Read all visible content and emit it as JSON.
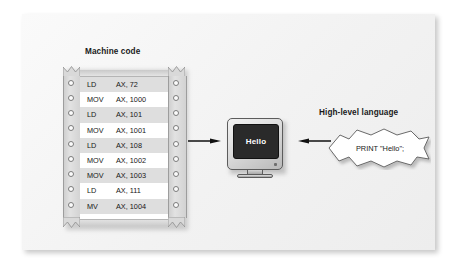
{
  "figure": {
    "machine_code_heading": "Machine code",
    "high_level_heading": "High-level language"
  },
  "machine_code": {
    "rows": [
      {
        "mnemonic": "LD",
        "operand": "AX, 72"
      },
      {
        "mnemonic": "MOV",
        "operand": "AX, 1000"
      },
      {
        "mnemonic": "LD",
        "operand": "AX, 101"
      },
      {
        "mnemonic": "MOV",
        "operand": "AX, 1001"
      },
      {
        "mnemonic": "LD",
        "operand": "AX, 108"
      },
      {
        "mnemonic": "MOV",
        "operand": "AX, 1002"
      },
      {
        "mnemonic": "MOV",
        "operand": "AX, 1003"
      },
      {
        "mnemonic": "LD",
        "operand": "AX, 111"
      },
      {
        "mnemonic": "MV",
        "operand": "AX, 1004"
      }
    ]
  },
  "monitor": {
    "screen_text": "Hello"
  },
  "high_level": {
    "code": "PRINT \"Hello\";"
  },
  "colors": {
    "panel_background": "#f4f4f4",
    "paper_white": "#ffffff",
    "row_shaded": "#dedede",
    "sprocket_gray": "#d6d6d6",
    "screen_dark": "#2a2a2a",
    "screen_text": "#ffffff",
    "ink": "#161616",
    "arrow": "#111111"
  }
}
